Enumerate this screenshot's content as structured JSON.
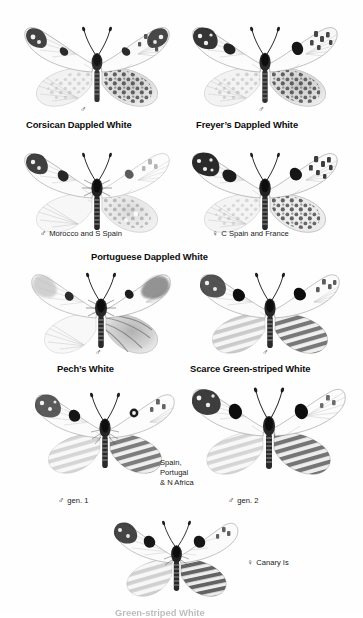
{
  "plate": {
    "background_color": "#ffffff",
    "ink_color": "#111111",
    "kind": "field-guide-specimen-plate",
    "subject": "Dappled White butterflies"
  },
  "symbols": {
    "male": "♂",
    "female": "♀"
  },
  "figures": [
    {
      "id": "corsican-dappled-white",
      "species_label": "Corsican Dappled White",
      "sex_glyph": "♂",
      "sex_text": "",
      "x": 18,
      "y": 14,
      "w": 158,
      "h": 100,
      "wing_style": "dappled",
      "label_x": 26,
      "label_y": 119,
      "sex_x": 80,
      "sex_y": 105
    },
    {
      "id": "freyers-dappled-white",
      "species_label": "Freyer’s Dappled White",
      "sex_glyph": "♂",
      "sex_text": "",
      "x": 186,
      "y": 14,
      "w": 158,
      "h": 100,
      "wing_style": "dappled",
      "label_x": 196,
      "label_y": 119,
      "sex_x": 258,
      "sex_y": 105
    },
    {
      "id": "portuguese-dappled-white-male",
      "species_label": "",
      "sex_glyph": "♂",
      "sex_text": "Morocco and S Spain",
      "x": 18,
      "y": 140,
      "w": 158,
      "h": 100,
      "wing_style": "dappled-pale",
      "label_x": 0,
      "label_y": 0,
      "sex_x": 40,
      "sex_y": 229
    },
    {
      "id": "portuguese-dappled-white-female",
      "species_label": "",
      "sex_glyph": "♀",
      "sex_text": "C Spain and France",
      "x": 186,
      "y": 140,
      "w": 158,
      "h": 100,
      "wing_style": "dappled-dark",
      "label_x": 0,
      "label_y": 0,
      "sex_x": 212,
      "sex_y": 229
    },
    {
      "id": "pechs-white",
      "species_label": "Pech’s White",
      "sex_glyph": "♂",
      "sex_text": "",
      "x": 26,
      "y": 262,
      "w": 150,
      "h": 100,
      "wing_style": "plain",
      "label_x": 57,
      "label_y": 363,
      "sex_x": 95,
      "sex_y": 348
    },
    {
      "id": "scarce-green-striped-white",
      "species_label": "Scarce Green-striped White",
      "sex_glyph": "♂",
      "sex_text": "",
      "x": 194,
      "y": 262,
      "w": 152,
      "h": 100,
      "wing_style": "striped",
      "label_x": 190,
      "label_y": 363,
      "sex_x": 262,
      "sex_y": 348
    },
    {
      "id": "green-striped-white-gen1",
      "species_label": "",
      "sex_glyph": "♂",
      "sex_text": "gen. 1",
      "x": 30,
      "y": 382,
      "w": 150,
      "h": 100,
      "wing_style": "striped-light",
      "label_x": 0,
      "label_y": 0,
      "sex_x": 58,
      "sex_y": 496
    },
    {
      "id": "green-striped-white-gen2",
      "species_label": "",
      "sex_glyph": "♂",
      "sex_text": "gen. 2",
      "x": 186,
      "y": 376,
      "w": 166,
      "h": 108,
      "wing_style": "striped",
      "label_x": 0,
      "label_y": 0,
      "sex_x": 228,
      "sex_y": 496
    },
    {
      "id": "green-striped-white-canary",
      "species_label": "",
      "sex_glyph": "♀",
      "sex_text": "Canary Is",
      "x": 110,
      "y": 512,
      "w": 132,
      "h": 92,
      "wing_style": "striped-dark",
      "label_x": 0,
      "label_y": 0,
      "sex_x": 247,
      "sex_y": 558
    }
  ],
  "group_headings": [
    {
      "id": "portuguese-dappled-white",
      "text": "Portuguese Dappled White",
      "x": 91,
      "y": 251
    }
  ],
  "region_notes": [
    {
      "id": "spain-portugal-n-africa",
      "text": "Spain,\nPortugal\n& N Africa",
      "x": 160,
      "y": 458
    }
  ],
  "bottom_caption": {
    "text": "Green-striped White",
    "x": 115,
    "y": 607,
    "note": "cut off at image edge"
  }
}
